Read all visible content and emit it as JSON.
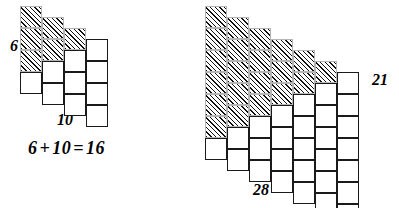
{
  "figure": {
    "kind": "triangular-number-staircase-diagram"
  },
  "colors": {
    "cell_outline": "#1a1a1a",
    "hatch_outline": "#b5b5b5",
    "hatch_line": "#111111",
    "cell_fill": "#ffffff",
    "background": "#ffffff",
    "text": "#000000"
  },
  "left_figure": {
    "name": "left-staircase",
    "columns": 4,
    "rows": 4,
    "cell_size": 22,
    "step_offset": 11,
    "white_counts": [
      1,
      2,
      3,
      4
    ],
    "hatch_counts": [
      3,
      2,
      1,
      0
    ],
    "white_total": 10,
    "hatch_total": 6,
    "grand_total": 16,
    "labels": {
      "hatched": "6",
      "white": "10"
    },
    "equation": {
      "left": "6",
      "plus": "+",
      "right": "10",
      "equals": "=",
      "sum": "16",
      "full": "6 + 10 = 16"
    }
  },
  "right_figure": {
    "name": "right-staircase",
    "columns": 7,
    "rows": 7,
    "cell_size": 22,
    "step_offset": 11,
    "white_counts": [
      1,
      2,
      3,
      4,
      5,
      6,
      7
    ],
    "hatch_counts": [
      6,
      5,
      4,
      3,
      2,
      1,
      0
    ],
    "white_total": 28,
    "hatch_total": 21,
    "grand_total": 49,
    "labels": {
      "hatched": "21",
      "white": "28"
    }
  }
}
